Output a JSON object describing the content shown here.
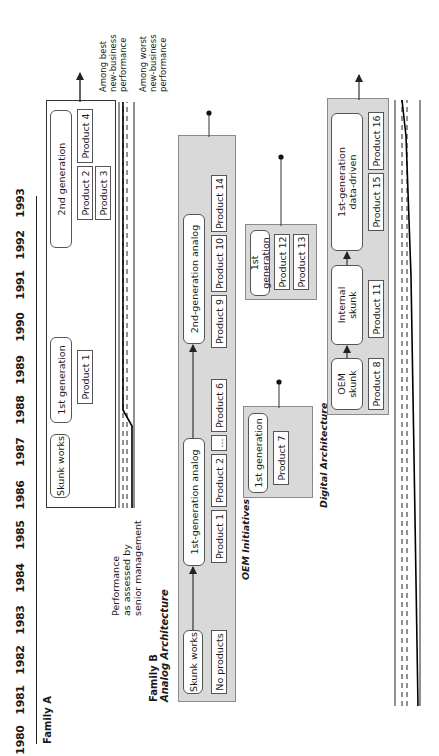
{
  "timeline": {
    "years": [
      "1980",
      "1981",
      "1982",
      "1983",
      "1984",
      "1985",
      "1986",
      "1987",
      "1988",
      "1989",
      "1990",
      "1991",
      "1992",
      "1993"
    ]
  },
  "family_a": {
    "title": "Family A",
    "stages": [
      {
        "label": "Skunk works",
        "products": []
      },
      {
        "label": "1st generation",
        "products": [
          "Product 1"
        ]
      },
      {
        "label": "2nd generation",
        "products": [
          "Product 2",
          "Product 3",
          "Product 4"
        ]
      }
    ]
  },
  "performance": {
    "label_lines": [
      "Performance",
      "as assessed by",
      "senior management"
    ],
    "best_lines": [
      "Among best",
      "new-business",
      "performance"
    ],
    "worst_lines": [
      "Among worst",
      "new-business",
      "performance"
    ]
  },
  "family_b": {
    "title": "Family B",
    "analog": {
      "title": "Analog Architecture",
      "stages": [
        {
          "label": "Skunk works",
          "products": [
            "No products"
          ]
        },
        {
          "label": "1st-generation analog",
          "products": [
            "Product 1",
            "Product 2",
            "...",
            "Product 6"
          ]
        },
        {
          "label": "2nd-generation analog",
          "products": [
            "Product 9",
            "Product 10",
            "Product 14"
          ]
        }
      ]
    },
    "oem": {
      "title": "OEM Initiatives",
      "groups": [
        {
          "label": "1st generation",
          "products": [
            "Product 7"
          ]
        },
        {
          "label": "1st generation",
          "products": [
            "Product 12",
            "Product 13"
          ]
        }
      ]
    },
    "digital": {
      "title": "Digital Architecture",
      "stages": [
        {
          "label_lines": [
            "OEM",
            "skunk"
          ],
          "products": [
            "Product 8"
          ]
        },
        {
          "label_lines": [
            "Internal",
            "skunk"
          ],
          "products": [
            "Product 11"
          ]
        },
        {
          "label_lines": [
            "1st-generation",
            "data-driven"
          ],
          "products": [
            "Product 15",
            "Product 16"
          ]
        }
      ]
    }
  },
  "colors": {
    "gray_fill": "#d9d9d9",
    "line": "#222222"
  }
}
